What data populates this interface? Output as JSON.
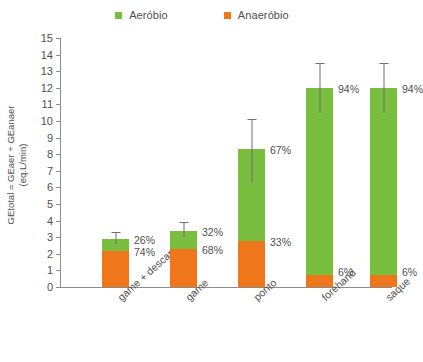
{
  "legend": {
    "position": "top-center",
    "items": [
      {
        "label": "Aeróbio",
        "color": "#79BE3F",
        "icon": "square-marker"
      },
      {
        "label": "Anaeróbio",
        "color": "#F0761B",
        "icon": "square-marker"
      }
    ]
  },
  "axis": {
    "y_title_line1": "GEtotal = GEaer + GEanaer",
    "y_title_line2": "(eq.L/min)",
    "ticks": [
      "0",
      "1",
      "2",
      "3",
      "4",
      "5",
      "6",
      "7",
      "8",
      "9",
      "10",
      "11",
      "12",
      "13",
      "14",
      "15"
    ]
  },
  "chart_data": {
    "type": "bar",
    "title": "",
    "subtitle": "",
    "xlabel": "",
    "ylabel": "GEtotal = GEaer + GEanaer (eq.L/min)",
    "ylim": [
      0,
      15
    ],
    "ytick_step": 1,
    "grid": false,
    "stacked": true,
    "legend_position": "top-center",
    "categories": [
      "game + descanso",
      "game",
      "ponto",
      "forehand",
      "saque"
    ],
    "series": [
      {
        "name": "Anaeróbio",
        "color": "#F0761B",
        "values": [
          2.15,
          2.3,
          2.75,
          0.72,
          0.72
        ],
        "percent_labels": [
          "74%",
          "68%",
          "33%",
          "6%",
          "6%"
        ]
      },
      {
        "name": "Aeróbio",
        "color": "#79BE3F",
        "values": [
          0.75,
          1.1,
          5.55,
          11.28,
          11.28
        ],
        "percent_labels": [
          "26%",
          "32%",
          "67%",
          "94%",
          "94%"
        ]
      }
    ],
    "totals": [
      2.9,
      3.4,
      8.3,
      12.0,
      12.0
    ],
    "error_bars": {
      "kind": "upper-and-lower-whisker",
      "upper": [
        3.3,
        3.9,
        10.1,
        13.5,
        13.5
      ],
      "lower": [
        2.6,
        3.0,
        6.3,
        10.5,
        10.5
      ]
    }
  }
}
